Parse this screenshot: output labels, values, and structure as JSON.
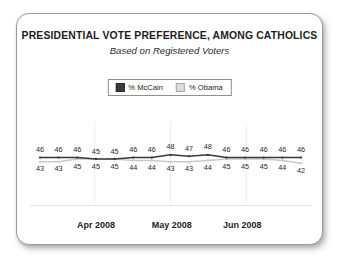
{
  "card": {
    "title": "PRESIDENTIAL VOTE PREFERENCE, AMONG CATHOLICS",
    "subtitle": "Based on Registered Voters"
  },
  "legend": {
    "entries": [
      {
        "label": "% McCain",
        "color": "#3a3a3a",
        "swatch": "dark"
      },
      {
        "label": "% Obama",
        "color": "#dcdcdc",
        "swatch": "light"
      }
    ]
  },
  "chart_data": {
    "type": "line",
    "title": "PRESIDENTIAL VOTE PREFERENCE, AMONG CATHOLICS",
    "subtitle": "Based on Registered Voters",
    "xlabel": "",
    "ylabel": "",
    "grid": true,
    "legend_position": "top-center",
    "ylim": [
      40,
      50
    ],
    "x_tick_labels": [
      "Apr 2008",
      "May 2008",
      "Jun 2008"
    ],
    "n_points": 15,
    "series": [
      {
        "name": "% McCain",
        "color": "#3a3a3a",
        "label_position": "above",
        "values": [
          46,
          46,
          46,
          45,
          45,
          46,
          46,
          48,
          47,
          48,
          46,
          46,
          46,
          46,
          46
        ]
      },
      {
        "name": "% Obama",
        "color": "#c9c9c9",
        "label_position": "below",
        "values": [
          43,
          43,
          45,
          45,
          45,
          44,
          44,
          43,
          43,
          44,
          45,
          45,
          45,
          44,
          42
        ]
      }
    ]
  }
}
